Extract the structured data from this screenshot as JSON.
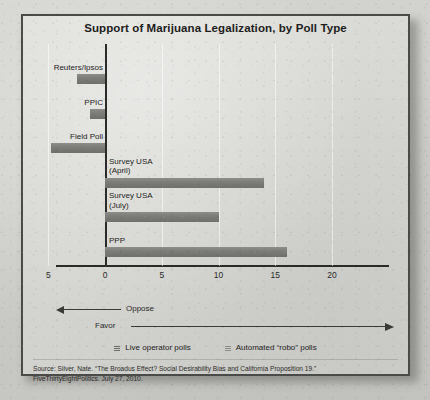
{
  "figure": {
    "title": "Support of Marijuana Legalization, by Poll Type",
    "source_note_line1": "Source: Silver, Nate. “The Broadus Effect? Social Desirability Bias and California Proposition 19.”",
    "source_note_line2": "FiveThirtyEightPolitics. July 27, 2010."
  },
  "annotations": {
    "oppose_label": "Oppose",
    "favor_label": "Favor",
    "oppose_arrow_icon": "arrow-left-icon",
    "favor_arrow_icon": "arrow-right-icon"
  },
  "legend": {
    "entries": [
      {
        "label": "Live operator polls",
        "swatch": "live",
        "color": "#6f6f6c"
      },
      {
        "label": "Automated “robo” polls",
        "swatch": "robo",
        "color": "#8a8a87"
      }
    ]
  },
  "colors": {
    "bar": "#7c7c79",
    "axis": "#2a2a28",
    "frame": "#4a4a48",
    "page_background": "#d6d6d2"
  },
  "chart_data": {
    "type": "bar",
    "orientation": "horizontal",
    "title": "Support of Marijuana Legalization, by Poll Type",
    "xlabel": "",
    "ylabel": "",
    "xlim": [
      -5,
      20
    ],
    "xticks": [
      -5,
      0,
      5,
      10,
      15,
      20
    ],
    "xtick_labels": [
      "5",
      "0",
      "5",
      "10",
      "15",
      "20"
    ],
    "grid": true,
    "legend_position": "bottom",
    "categories": [
      "Reuters/Ipsos",
      "PPIC",
      "Field Poll",
      "Survey USA\n(April)",
      "Survey USA\n(July)",
      "PPP"
    ],
    "values": [
      -2.5,
      -1.3,
      -4.8,
      14.0,
      10.0,
      16.0
    ],
    "poll_types": [
      "Live operator polls",
      "Live operator polls",
      "Live operator polls",
      "Automated \"robo\" polls",
      "Automated \"robo\" polls",
      "Automated \"robo\" polls"
    ],
    "annotations": [
      "Oppose",
      "Favor"
    ]
  }
}
